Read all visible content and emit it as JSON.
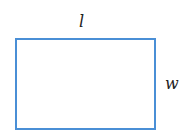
{
  "diagram": {
    "shape": "rectangle",
    "stroke_color": "#4a8fd6",
    "labels": {
      "top": "l",
      "right": "w"
    }
  }
}
